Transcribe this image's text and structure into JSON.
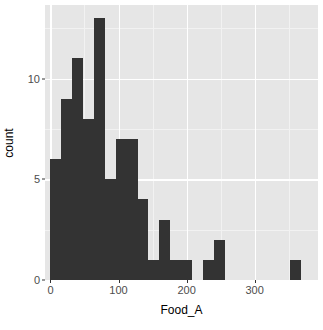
{
  "chart_data": {
    "type": "bar",
    "title": "",
    "subtitle": "",
    "xlabel": "Food_A",
    "ylabel": "count",
    "xlim": [
      -8,
      393
    ],
    "ylim": [
      0,
      13.65
    ],
    "grid": true,
    "legend": null,
    "bin_width": 16,
    "bin_starts": [
      0,
      16,
      32,
      48,
      64,
      80,
      96,
      112,
      128,
      144,
      160,
      176,
      192,
      208,
      224,
      240,
      256,
      272,
      288,
      304,
      320,
      336,
      352
    ],
    "values": [
      6,
      9,
      11,
      8,
      13,
      5,
      7,
      7,
      4,
      1,
      3,
      1,
      1,
      0,
      1,
      2,
      0,
      0,
      0,
      0,
      0,
      0,
      1
    ],
    "x_ticks": [
      {
        "value": 0,
        "label": "0"
      },
      {
        "value": 100,
        "label": "100"
      },
      {
        "value": 200,
        "label": "200"
      },
      {
        "value": 300,
        "label": "300"
      }
    ],
    "x_minor_ticks": [
      50,
      150,
      250,
      350
    ],
    "y_ticks": [
      {
        "value": 0,
        "label": "0"
      },
      {
        "value": 5,
        "label": "5"
      },
      {
        "value": 10,
        "label": "10"
      }
    ],
    "y_minor_ticks": [
      2.5,
      7.5,
      12.5
    ],
    "colors": {
      "bar_fill": "#333333",
      "panel_background": "#e6e6e6",
      "grid_major": "#ffffff",
      "grid_minor": "#f2f2f2",
      "axis_text": "#4d4d4d",
      "axis_title": "#000000",
      "plot_background": "#ffffff"
    }
  }
}
